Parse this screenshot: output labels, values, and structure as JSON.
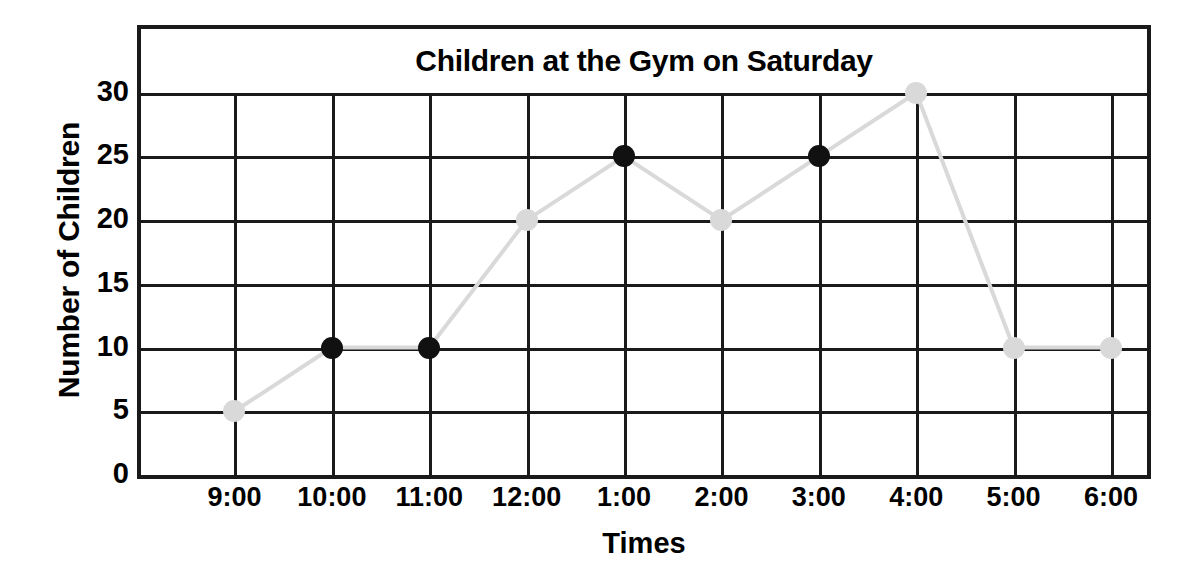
{
  "chart_data": {
    "type": "line",
    "title": "Children at the Gym on Saturday",
    "xlabel": "Times",
    "ylabel": "Number of Children",
    "categories": [
      "9:00",
      "10:00",
      "11:00",
      "12:00",
      "1:00",
      "2:00",
      "3:00",
      "4:00",
      "5:00",
      "6:00"
    ],
    "values": [
      5,
      10,
      10,
      20,
      25,
      20,
      25,
      30,
      10,
      10
    ],
    "point_styles": [
      "faded",
      "solid",
      "solid",
      "faded",
      "solid",
      "faded",
      "solid",
      "faded",
      "faded",
      "faded"
    ],
    "ylim": [
      0,
      35
    ],
    "yticks": [
      0,
      5,
      10,
      15,
      20,
      25,
      30
    ],
    "ytick_labels": [
      "0",
      "5",
      "10",
      "15",
      "20",
      "25",
      "30"
    ],
    "grid": true,
    "legend": "none",
    "line_color": "#d9d9d9",
    "marker_color": "#111111",
    "faded_marker_color": "#d9d9d9",
    "grid_color": "#1a1a1a",
    "frame_color": "#1a1a1a",
    "background": "#ffffff"
  }
}
